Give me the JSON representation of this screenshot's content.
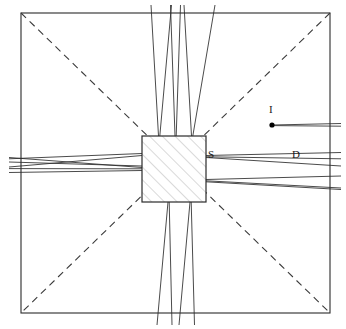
{
  "figure": {
    "kind": "optical-ray-diagram",
    "background": "#ffffff",
    "stroke_color": "#2b2b2b",
    "hatch_color": "#b5b5b5",
    "dashed_color": "#3a3a3a"
  },
  "frame": {
    "name": "outer-boundary-square",
    "x": 21,
    "y": 13,
    "width": 309,
    "height": 300,
    "stroke": "#2b2b2b",
    "stroke_width": 1.1
  },
  "scatterer": {
    "name": "central-hatched-square",
    "x": 142,
    "y": 136,
    "width": 64,
    "height": 66,
    "stroke": "#2b2b2b",
    "stroke_width": 1.2,
    "hatch_angle_deg": -45,
    "hatch_spacing": 9,
    "hatch_color": "#b3b3b3"
  },
  "diagonals": [
    {
      "name": "diagonal-tl-br",
      "x1": 21,
      "y1": 13,
      "x2": 330,
      "y2": 313,
      "dash": "7 5"
    },
    {
      "name": "diagonal-tr-bl",
      "x1": 330,
      "y1": 13,
      "x2": 21,
      "y2": 313,
      "dash": "7 5"
    }
  ],
  "source_point": {
    "name": "incident-source-point",
    "cx": 272,
    "cy": 125,
    "r": 2.6,
    "fill": "#000000"
  },
  "labels": [
    {
      "name": "label-I",
      "text": "I",
      "x": 269,
      "y": 104
    },
    {
      "name": "label-S",
      "text": "S",
      "x": 208,
      "y": 149
    },
    {
      "name": "label-D",
      "text": "D",
      "x": 292,
      "y": 149
    }
  ],
  "ray_bundles": {
    "incident_ray": [
      {
        "name": "ray-incident",
        "x1": 272,
        "y1": 125,
        "x2": 341,
        "y2": 123.5
      },
      {
        "name": "ray-incident-b",
        "x1": 272,
        "y1": 125.6,
        "x2": 341,
        "y2": 126.2
      }
    ],
    "left_bundle": [
      {
        "name": "ray-left-1",
        "x1": 9,
        "y1": 157.5,
        "x2": 142,
        "y2": 167.5
      },
      {
        "name": "ray-left-2",
        "x1": 9,
        "y1": 158.8,
        "x2": 142,
        "y2": 153.5
      },
      {
        "name": "ray-left-3",
        "x1": 9,
        "y1": 167.0,
        "x2": 142,
        "y2": 155.5
      },
      {
        "name": "ray-left-4",
        "x1": 9,
        "y1": 168.6,
        "x2": 142,
        "y2": 168.8
      },
      {
        "name": "ray-left-5",
        "x1": 9,
        "y1": 172.5,
        "x2": 142,
        "y2": 170.5
      },
      {
        "name": "ray-left-6",
        "x1": 9,
        "y1": 162.0,
        "x2": 142,
        "y2": 166.0
      }
    ],
    "right_upper_bundle": [
      {
        "name": "ray-right-u1",
        "x1": 206,
        "y1": 155.5,
        "x2": 341,
        "y2": 152.5
      },
      {
        "name": "ray-right-u2",
        "x1": 206,
        "y1": 156.8,
        "x2": 341,
        "y2": 158.8
      },
      {
        "name": "ray-right-u3",
        "x1": 206,
        "y1": 157.5,
        "x2": 341,
        "y2": 166.0
      }
    ],
    "right_lower_bundle": [
      {
        "name": "ray-right-l1",
        "x1": 206,
        "y1": 179.5,
        "x2": 341,
        "y2": 176.0
      },
      {
        "name": "ray-right-l2",
        "x1": 206,
        "y1": 180.8,
        "x2": 341,
        "y2": 188.0
      },
      {
        "name": "ray-right-l3",
        "x1": 206,
        "y1": 181.8,
        "x2": 341,
        "y2": 189.5
      }
    ],
    "top_bundle": [
      {
        "name": "ray-top-1",
        "x1": 158.5,
        "y1": 136,
        "x2": 151.0,
        "y2": 5
      },
      {
        "name": "ray-top-2",
        "x1": 159.8,
        "y1": 136,
        "x2": 171.5,
        "y2": 5
      },
      {
        "name": "ray-top-3",
        "x1": 175.0,
        "y1": 136,
        "x2": 170.5,
        "y2": 5
      },
      {
        "name": "ray-top-4",
        "x1": 176.2,
        "y1": 136,
        "x2": 180.5,
        "y2": 5
      },
      {
        "name": "ray-top-5",
        "x1": 191.5,
        "y1": 136,
        "x2": 184.0,
        "y2": 5
      },
      {
        "name": "ray-top-6",
        "x1": 192.8,
        "y1": 136,
        "x2": 215.0,
        "y2": 5
      }
    ],
    "bottom_bundle": [
      {
        "name": "ray-bot-1",
        "x1": 168.0,
        "y1": 202,
        "x2": 157.0,
        "y2": 325
      },
      {
        "name": "ray-bot-2",
        "x1": 169.2,
        "y1": 202,
        "x2": 172.0,
        "y2": 325
      },
      {
        "name": "ray-bot-3",
        "x1": 190.0,
        "y1": 202,
        "x2": 179.0,
        "y2": 325
      },
      {
        "name": "ray-bot-4",
        "x1": 191.2,
        "y1": 202,
        "x2": 194.5,
        "y2": 325
      }
    ]
  }
}
